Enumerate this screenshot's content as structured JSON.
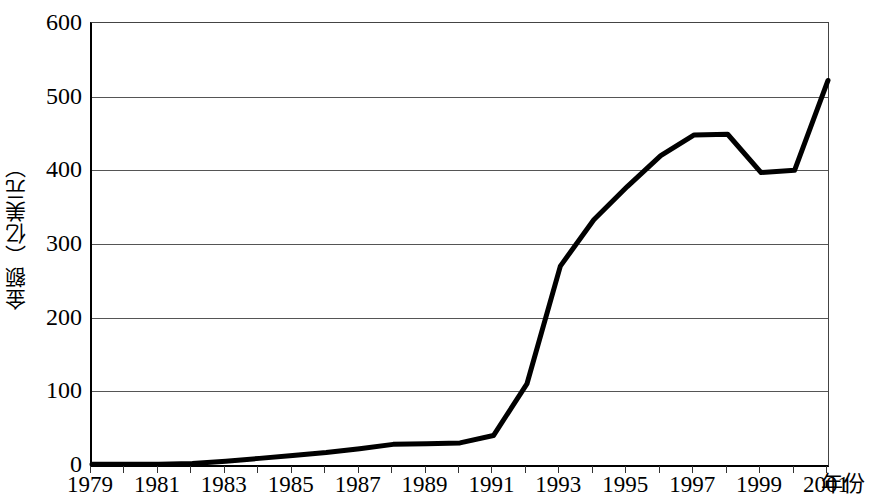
{
  "chart_data": {
    "type": "line",
    "title": "",
    "xlabel": "年份",
    "ylabel": "金额（亿美元）",
    "xlim": [
      1979,
      2001
    ],
    "ylim": [
      0,
      600
    ],
    "ytick_step": 100,
    "yticks": [
      0,
      100,
      200,
      300,
      400,
      500,
      600
    ],
    "ytick_labels": [
      "0",
      "100",
      "200",
      "300",
      "400",
      "500",
      "600"
    ],
    "xticks": [
      1979,
      1980,
      1981,
      1982,
      1983,
      1984,
      1985,
      1986,
      1987,
      1988,
      1989,
      1990,
      1991,
      1992,
      1993,
      1994,
      1995,
      1996,
      1997,
      1998,
      1999,
      2000,
      2001
    ],
    "xtick_labels_shown": [
      "1979",
      "1981",
      "1983",
      "1985",
      "1987",
      "1989",
      "1991",
      "1993",
      "1995",
      "1997",
      "1999",
      "2001"
    ],
    "xtick_labels_shown_values": [
      1979,
      1981,
      1983,
      1985,
      1987,
      1989,
      1991,
      1993,
      1995,
      1997,
      1999,
      2001
    ],
    "grid": "horizontal",
    "legend": "none",
    "line_color": "#000000",
    "line_width": 5,
    "x": [
      1979,
      1980,
      1981,
      1982,
      1983,
      1984,
      1985,
      1986,
      1987,
      1988,
      1989,
      1990,
      1991,
      1992,
      1993,
      1994,
      1995,
      1996,
      1997,
      1998,
      1999,
      2000,
      2001
    ],
    "values": [
      1,
      1,
      1,
      2,
      5,
      9,
      13,
      17,
      22,
      28,
      29,
      30,
      40,
      110,
      270,
      333,
      378,
      420,
      448,
      449,
      397,
      400,
      522
    ],
    "series": [
      {
        "name": "金额（亿美元）",
        "values": [
          1,
          1,
          1,
          2,
          5,
          9,
          13,
          17,
          22,
          28,
          29,
          30,
          40,
          110,
          270,
          333,
          378,
          420,
          448,
          449,
          397,
          400,
          522
        ]
      }
    ]
  },
  "axis": {
    "y_title": "金额（亿美元）",
    "x_unit": "年份"
  }
}
